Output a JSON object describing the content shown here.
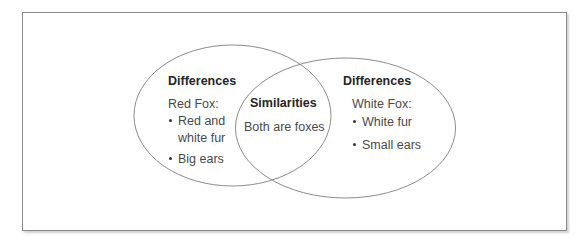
{
  "diagram": {
    "type": "venn",
    "left_set": {
      "heading": "Differences",
      "subject": "Red Fox:",
      "items": [
        "Red and",
        "white fur",
        "Big ears"
      ],
      "items_logical": [
        "Red and white fur",
        "Big ears"
      ]
    },
    "intersection": {
      "heading": "Similarities",
      "text": "Both are foxes"
    },
    "right_set": {
      "heading": "Differences",
      "subject": "White Fox:",
      "items": [
        "White fur",
        "Small ears"
      ]
    },
    "colors": {
      "frame_border": "#8a8a8a",
      "circle_stroke": "#8c8c8c",
      "heading_text": "#262626",
      "body_text": "#4a4a4a",
      "background": "#ffffff"
    }
  }
}
